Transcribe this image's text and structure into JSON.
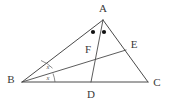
{
  "figure": {
    "kind": "euclidean-geometry-diagram",
    "background_color": "#ffffff",
    "line_color": "#4a4a4a",
    "label_color": "#3a3a3a",
    "mark_color": "#111111",
    "width": 169,
    "height": 107
  },
  "vertices": {
    "A": {
      "label": "A",
      "x": 103,
      "y": 20,
      "label_x": 103,
      "label_y": 9
    },
    "B": {
      "label": "B",
      "x": 22,
      "y": 82,
      "label_x": 11,
      "label_y": 80
    },
    "C": {
      "label": "C",
      "x": 148,
      "y": 82,
      "label_x": 157,
      "label_y": 83
    },
    "D": {
      "label": "D",
      "x": 91,
      "y": 82,
      "label_x": 91,
      "label_y": 95
    },
    "E": {
      "label": "E",
      "x": 126,
      "y": 50,
      "label_x": 134,
      "label_y": 45
    },
    "F": {
      "label": "F",
      "x": 96,
      "y": 56,
      "label_x": 88,
      "label_y": 50
    }
  },
  "segments": [
    {
      "name": "side-AB",
      "from": "A",
      "to": "B"
    },
    {
      "name": "side-BC",
      "from": "B",
      "to": "C"
    },
    {
      "name": "side-CA",
      "from": "C",
      "to": "A"
    },
    {
      "name": "cevian-AD",
      "from": "A",
      "to": "D"
    },
    {
      "name": "cevian-BE",
      "from": "B",
      "to": "E"
    }
  ],
  "angle_marks": {
    "vertex_A": {
      "type": "dots",
      "count": 2,
      "meaning": "equal-angles-BAD-DAC",
      "dots": [
        {
          "cx": 93,
          "cy": 32,
          "r": 2.1
        },
        {
          "cx": 104,
          "cy": 32,
          "r": 2.1
        }
      ]
    },
    "vertex_B": {
      "type": "labeled-arcs",
      "count": 2,
      "meaning": "equal-angles-ABE-EBC",
      "marks": [
        {
          "label": "x",
          "label_x": 48,
          "label_y": 68
        },
        {
          "label": "x",
          "label_x": 48,
          "label_y": 79
        }
      ]
    }
  }
}
